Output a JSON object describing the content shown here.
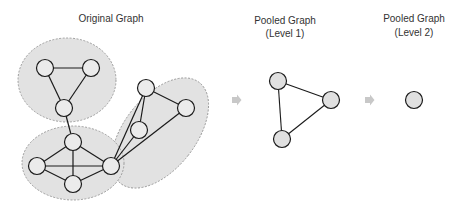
{
  "titles": {
    "original": "Original Graph",
    "level1_line1": "Pooled Graph",
    "level1_line2": "(Level 1)",
    "level2_line1": "Pooled Graph",
    "level2_line2": "(Level 2)"
  },
  "colors": {
    "cluster_fill": "#e2e2e2",
    "cluster_stroke": "#8a8a8a",
    "node_fill_original": "#ebebeb",
    "node_fill_pooled": "#e0e0e0",
    "node_stroke": "#1a1a1a",
    "edge": "#1a1a1a",
    "arrow": "#c8c8c8"
  },
  "original_graph": {
    "clusters": 3,
    "nodes": 10,
    "edges": [
      [
        "A",
        "B"
      ],
      [
        "A",
        "C"
      ],
      [
        "B",
        "C"
      ],
      [
        "C",
        "D"
      ],
      [
        "D",
        "E"
      ],
      [
        "D",
        "F"
      ],
      [
        "D",
        "G"
      ],
      [
        "E",
        "F"
      ],
      [
        "E",
        "G"
      ],
      [
        "F",
        "G"
      ],
      [
        "G",
        "H"
      ],
      [
        "G",
        "J"
      ],
      [
        "G",
        "I"
      ],
      [
        "H",
        "J"
      ],
      [
        "H",
        "I"
      ]
    ]
  },
  "pooled_level1": {
    "nodes": 3,
    "edges": [
      [
        "P1",
        "P2"
      ],
      [
        "P1",
        "P3"
      ],
      [
        "P2",
        "P3"
      ]
    ]
  },
  "pooled_level2": {
    "nodes": 1,
    "edges": []
  }
}
